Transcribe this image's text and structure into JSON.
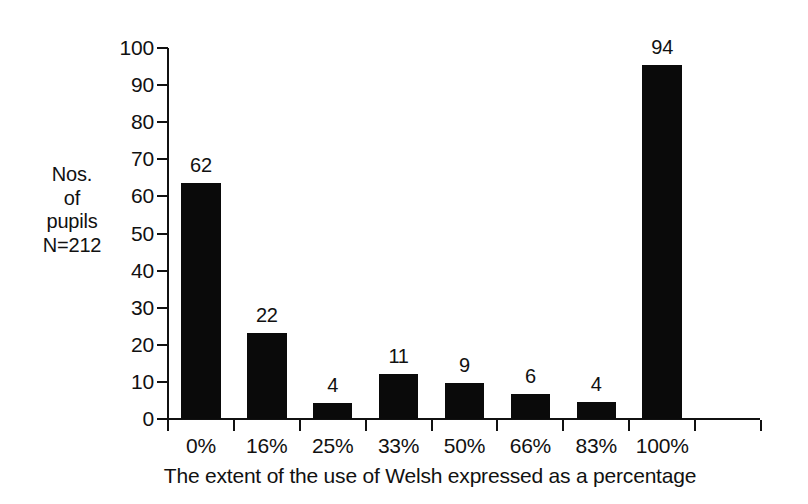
{
  "chart_data": {
    "type": "bar",
    "title": "",
    "subtitle": "",
    "xlabel": "The extent of the use of Welsh expressed as a percentage",
    "ylabel": "Nos.\nof\npupils\nN=212",
    "categories": [
      "0%",
      "16%",
      "25%",
      "33%",
      "50%",
      "66%",
      "83%",
      "100%"
    ],
    "values": [
      62,
      22,
      4,
      11,
      9,
      6,
      4,
      94
    ],
    "bar_labels": [
      "62",
      "22",
      "4",
      "11",
      "9",
      "6",
      "4",
      "94"
    ],
    "drawn_values": [
      63.5,
      23.2,
      4.3,
      12.0,
      9.7,
      6.7,
      4.6,
      95.5
    ],
    "ylim": [
      0,
      100
    ],
    "ytick_labels": [
      "0",
      "10",
      "20",
      "30",
      "40",
      "50",
      "60",
      "70",
      "80",
      "90",
      "100"
    ],
    "ytick_values": [
      0,
      10,
      20,
      30,
      40,
      50,
      60,
      70,
      80,
      90,
      100
    ],
    "grid": false,
    "legend": false,
    "bar_color": "#0a0a0a",
    "axis_color": "#111111",
    "background_color": "#ffffff",
    "total_label": "N=212"
  },
  "figure": {
    "plot_left": 168,
    "plot_right": 761,
    "plot_top": 48,
    "plot_bottom": 419
  }
}
